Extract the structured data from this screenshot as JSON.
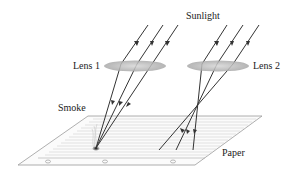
{
  "diagram": {
    "labels": {
      "sunlight": "Sunlight",
      "lens1": "Lens 1",
      "lens2": "Lens 2",
      "smoke": "Smoke",
      "paper": "Paper"
    },
    "colors": {
      "ray": "#333333",
      "lens_fill": "#b8b8b8",
      "paper_edge": "#9a9a9a",
      "paper_lines": "#cfcfcf",
      "text": "#222222"
    }
  }
}
